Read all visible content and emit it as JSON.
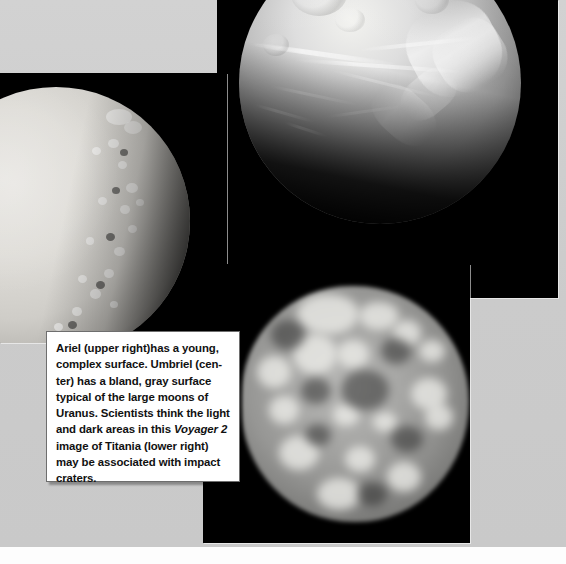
{
  "page": {
    "width": 566,
    "height": 564,
    "background_color": "#cfcfcf",
    "bottom_strip_color": "#fdfdfd"
  },
  "photos": [
    {
      "id": "ariel",
      "name": "ariel-photo",
      "subject": "Ariel",
      "position": "upper right",
      "frame_color": "#000000",
      "body_description": "Bright heavily-grooved icy moon limb, lit from upper left, terminator across lower portion"
    },
    {
      "id": "umbriel",
      "name": "umbriel-photo",
      "subject": "Umbriel",
      "position": "center",
      "frame_color": "#000000",
      "body_description": "Bland gray cratered disc, speckled terminator along right limb"
    },
    {
      "id": "titania",
      "name": "titania-photo",
      "subject": "Titania",
      "position": "lower right",
      "frame_color": "#000000",
      "body_description": "Low-resolution blurred gray disc with mottled light and dark patches"
    }
  ],
  "caption": {
    "segments": [
      {
        "text": "Ariel (upper right)has a young, complex surface. Umbriel (cen-ter) has a bland, gray surface typical of the large moons of Uranus. Scientists think the light and dark areas in this ",
        "style": "normal"
      },
      {
        "text": "Voyager 2",
        "style": "italic"
      },
      {
        "text": " image of Titania (lower right) may be associated with impact craters.",
        "style": "normal"
      }
    ],
    "full_text": "Ariel (upper right)has a young, complex surface. Umbriel (center) has a bland, gray surface typical of the large moons of Uranus. Scientists think the light and dark areas in this Voyager 2 image of Titania (lower right) may be associated with impact craters.",
    "text_color": "#111111",
    "background_color": "#ffffff",
    "border_color": "#6e6e6e"
  }
}
